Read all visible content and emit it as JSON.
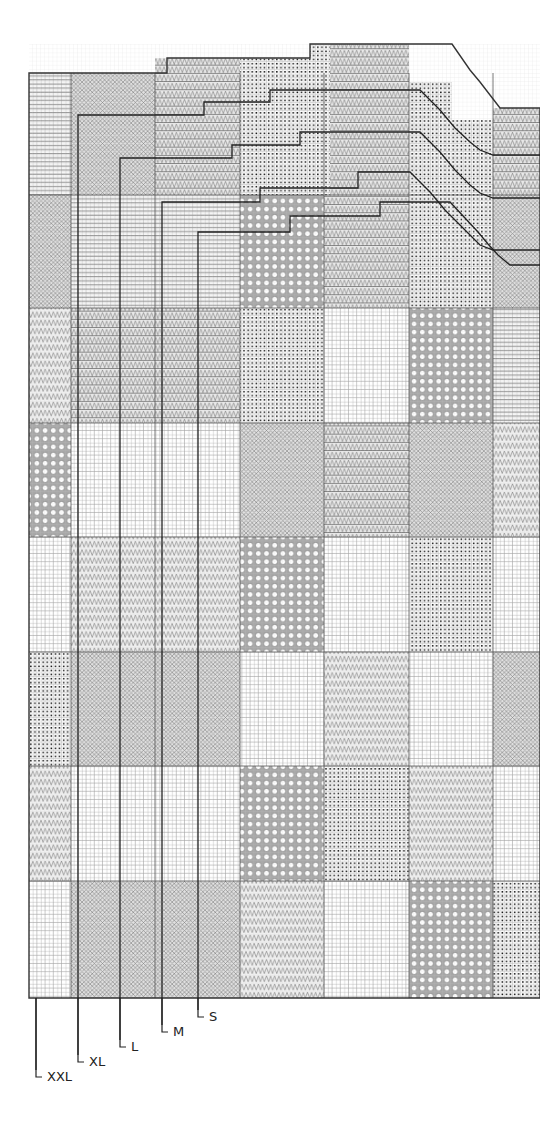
{
  "chart": {
    "grid": {
      "left": 29,
      "right": 540,
      "top_main": 73,
      "bottom": 998,
      "cell": 4.1,
      "block_cols_x": [
        29,
        71,
        155,
        240,
        324,
        409,
        493,
        540
      ],
      "block_rows_y": [
        73,
        195,
        308,
        423,
        537,
        652,
        766,
        881,
        998
      ]
    },
    "legend_patterns": [
      "hbars",
      "xdiamond",
      "zigzagbars",
      "dots",
      "circles",
      "zigzag",
      "plain"
    ],
    "blocks": [
      [
        "zigzag-top-hbars",
        "xdiamond",
        "xdiamond",
        "zigzagbars",
        "hbars",
        "zigzagbars",
        "dots",
        "xdiamond",
        "dots",
        "zigzagbars"
      ],
      [
        "xdiamond",
        "hbars",
        "hbars",
        "circles",
        "zigzagbars",
        "dots",
        "xdiamond",
        "hbars"
      ],
      [
        "zigzag",
        "zigzagbars",
        "zigzagbars",
        "dots",
        "plain",
        "circles",
        "hbars",
        "zigzag"
      ],
      [
        "circles",
        "plain",
        "plain",
        "xdiamond",
        "zigzagbars",
        "xdiamond",
        "zigzag",
        "circles"
      ],
      [
        "plain",
        "zigzag",
        "zigzag",
        "circles",
        "plain",
        "dots",
        "plain",
        "xdiamond"
      ],
      [
        "dots",
        "xdiamond",
        "xdiamond",
        "plain",
        "zigzag",
        "plain",
        "xdiamond",
        "plain"
      ],
      [
        "zigzag",
        "plain",
        "plain",
        "circles",
        "dots",
        "zigzag",
        "plain",
        "circles"
      ],
      [
        "plain",
        "xdiamond",
        "xdiamond",
        "zigzag",
        "plain",
        "circles",
        "dots",
        "plain"
      ]
    ],
    "size_labels": [
      {
        "label": "S",
        "line_x": 198,
        "label_y": 1017
      },
      {
        "label": "M",
        "line_x": 162,
        "label_y": 1032
      },
      {
        "label": "L",
        "line_x": 120,
        "label_y": 1047
      },
      {
        "label": "XL",
        "line_x": 78,
        "label_y": 1062
      },
      {
        "label": "XXL",
        "line_x": 36,
        "label_y": 1077
      }
    ]
  }
}
